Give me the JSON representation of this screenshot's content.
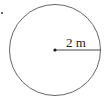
{
  "diagram": {
    "type": "circle",
    "radius_label": "2 m",
    "stroke_color": "#555555",
    "marker": "•"
  }
}
